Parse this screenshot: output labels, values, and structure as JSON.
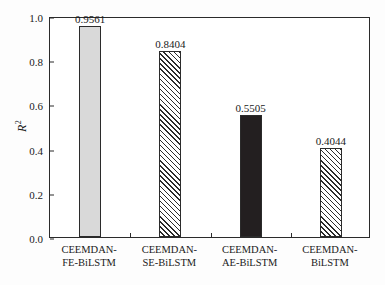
{
  "chart_data": {
    "type": "bar",
    "title": "",
    "subtitle": "",
    "xlabel": "",
    "ylabel": "R²",
    "ylabel_base": "R",
    "ylabel_sup": "2",
    "ylim": [
      0.0,
      1.0
    ],
    "yticks": [
      "0.0",
      "0.2",
      "0.4",
      "0.6",
      "0.8",
      "1.0"
    ],
    "ytick_values": [
      0.0,
      0.2,
      0.4,
      0.6,
      0.8,
      1.0
    ],
    "grid": false,
    "legend": "none",
    "categories": [
      "CEEMDAN-FE-BiLSTM",
      "CEEMDAN-SE-BiLSTM",
      "CEEMDAN-AE-BiLSTM",
      "CEEMDAN-BiLSTM"
    ],
    "category_lines": [
      [
        "CEEMDAN-",
        "FE-BiLSTM"
      ],
      [
        "CEEMDAN-",
        "SE-BiLSTM"
      ],
      [
        "CEEMDAN-",
        "AE-BiLSTM"
      ],
      [
        "CEEMDAN-",
        "BiLSTM"
      ]
    ],
    "values": [
      0.9561,
      0.8404,
      0.5505,
      0.4044
    ],
    "value_labels": [
      "0.9561",
      "0.8404",
      "0.5505",
      "0.4044"
    ],
    "bar_fills": [
      "solid-light",
      "hatch",
      "solid-dark",
      "hatch"
    ],
    "colors": {
      "bar_light": "#d9d9d9",
      "bar_dark": "#231f20",
      "hatch_line": "#2b2b2b",
      "axis": "#2b2b2b",
      "text": "#1a1a1a",
      "background": "#ffffff"
    }
  }
}
